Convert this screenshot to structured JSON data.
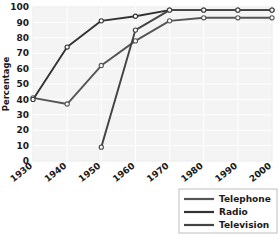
{
  "chart_data": {
    "type": "line",
    "title": "",
    "xlabel": "",
    "ylabel": "Percentage",
    "categories": [
      1930,
      1940,
      1950,
      1960,
      1970,
      1980,
      1990,
      2000
    ],
    "xtick_labels": [
      "1930",
      "1940",
      "1950",
      "1960",
      "1970",
      "1980",
      "1990",
      "2000"
    ],
    "ytick_labels": [
      "0",
      "10",
      "20",
      "30",
      "40",
      "50",
      "60",
      "70",
      "80",
      "90",
      "100"
    ],
    "ylim": [
      0,
      100
    ],
    "xlim": [
      1930,
      2000
    ],
    "grid": true,
    "legend_position": "bottom-right",
    "marker": "open-circle",
    "series": [
      {
        "name": "Telephone",
        "color": "#555555",
        "x": [
          1930,
          1940,
          1950,
          1960,
          1970,
          1980,
          1990,
          2000
        ],
        "values": [
          41,
          37,
          62,
          78,
          91,
          93,
          93,
          93
        ]
      },
      {
        "name": "Radio",
        "color": "#333333",
        "x": [
          1930,
          1940,
          1950,
          1960,
          1970,
          1980,
          1990,
          2000
        ],
        "values": [
          40,
          74,
          91,
          94,
          98,
          98,
          98,
          98
        ]
      },
      {
        "name": "Television",
        "color": "#444444",
        "x": [
          1950,
          1960,
          1970,
          1980,
          1990,
          2000
        ],
        "values": [
          9,
          85,
          98,
          98,
          98,
          98
        ]
      }
    ]
  },
  "legend": {
    "items": [
      {
        "label": "Telephone"
      },
      {
        "label": "Radio"
      },
      {
        "label": "Television"
      }
    ]
  },
  "style": {
    "plot_background": "#f4f4f4",
    "grid_color": "#ffffff",
    "plot_border": "#c8c8c8",
    "text_color": "#1a1a1a",
    "legend_border": "#b0b0b0"
  }
}
